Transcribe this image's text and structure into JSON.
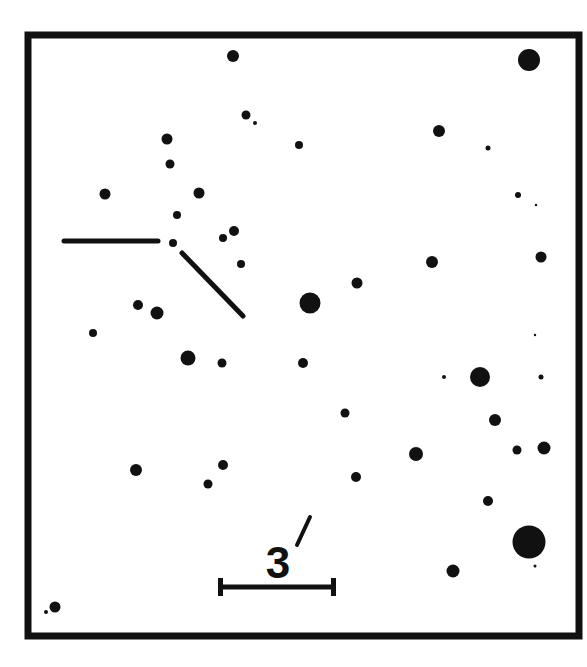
{
  "chart": {
    "frame": {
      "x": 28,
      "y": 35,
      "width": 551,
      "height": 601,
      "stroke": "#111111",
      "stroke_width": 7
    },
    "star_color": "#111111",
    "background": "#ffffff"
  },
  "scale_bar": {
    "label": "3",
    "unit_mark": "′",
    "label_full": "3′",
    "x1": 219,
    "x2": 335,
    "y": 587
  },
  "marker": {
    "horizontal": {
      "x1": 64,
      "y1": 241,
      "x2": 158,
      "y2": 241
    },
    "diagonal": {
      "x1": 182,
      "y1": 253,
      "x2": 243,
      "y2": 316
    },
    "target_star": {
      "x": 173,
      "y": 243,
      "r": 4
    }
  },
  "stars": [
    {
      "x": 233,
      "y": 56,
      "r": 6
    },
    {
      "x": 529,
      "y": 60,
      "r": 11
    },
    {
      "x": 246,
      "y": 115,
      "r": 4.5
    },
    {
      "x": 255,
      "y": 123,
      "r": 2
    },
    {
      "x": 167,
      "y": 139,
      "r": 5.5
    },
    {
      "x": 439,
      "y": 131,
      "r": 6
    },
    {
      "x": 299,
      "y": 145,
      "r": 4
    },
    {
      "x": 488,
      "y": 148,
      "r": 2.5
    },
    {
      "x": 170,
      "y": 164,
      "r": 4.5
    },
    {
      "x": 105,
      "y": 194,
      "r": 5.5
    },
    {
      "x": 199,
      "y": 193,
      "r": 5.5
    },
    {
      "x": 518,
      "y": 195,
      "r": 3
    },
    {
      "x": 536,
      "y": 205,
      "r": 1.2
    },
    {
      "x": 177,
      "y": 215,
      "r": 4
    },
    {
      "x": 234,
      "y": 231,
      "r": 5
    },
    {
      "x": 223,
      "y": 238,
      "r": 4
    },
    {
      "x": 241,
      "y": 264,
      "r": 4
    },
    {
      "x": 432,
      "y": 262,
      "r": 6
    },
    {
      "x": 541,
      "y": 257,
      "r": 5.5
    },
    {
      "x": 357,
      "y": 283,
      "r": 5.5
    },
    {
      "x": 310,
      "y": 303,
      "r": 10.5
    },
    {
      "x": 138,
      "y": 305,
      "r": 5
    },
    {
      "x": 157,
      "y": 313,
      "r": 6.5
    },
    {
      "x": 93,
      "y": 333,
      "r": 4
    },
    {
      "x": 535,
      "y": 335,
      "r": 1.2
    },
    {
      "x": 188,
      "y": 358,
      "r": 7.5
    },
    {
      "x": 222,
      "y": 363,
      "r": 4.5
    },
    {
      "x": 303,
      "y": 363,
      "r": 5
    },
    {
      "x": 444,
      "y": 377,
      "r": 2
    },
    {
      "x": 480,
      "y": 377,
      "r": 10
    },
    {
      "x": 541,
      "y": 377,
      "r": 2.5
    },
    {
      "x": 345,
      "y": 413,
      "r": 4.5
    },
    {
      "x": 495,
      "y": 420,
      "r": 6
    },
    {
      "x": 416,
      "y": 454,
      "r": 7
    },
    {
      "x": 517,
      "y": 450,
      "r": 4.5
    },
    {
      "x": 544,
      "y": 448,
      "r": 6.5
    },
    {
      "x": 136,
      "y": 470,
      "r": 6
    },
    {
      "x": 223,
      "y": 465,
      "r": 5
    },
    {
      "x": 208,
      "y": 484,
      "r": 4.5
    },
    {
      "x": 356,
      "y": 477,
      "r": 5
    },
    {
      "x": 488,
      "y": 501,
      "r": 5
    },
    {
      "x": 529,
      "y": 542,
      "r": 16.5
    },
    {
      "x": 535,
      "y": 566,
      "r": 1.5
    },
    {
      "x": 453,
      "y": 571,
      "r": 6.5
    },
    {
      "x": 55,
      "y": 607,
      "r": 5.5
    },
    {
      "x": 46,
      "y": 612,
      "r": 2
    }
  ]
}
